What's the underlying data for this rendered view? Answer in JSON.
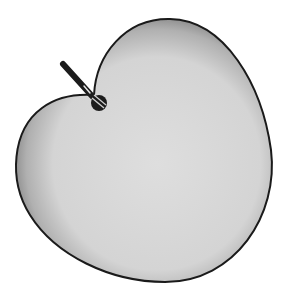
{
  "diagram": {
    "type": "cardioid-polar-pattern",
    "colors": {
      "background": "#ffffff",
      "fill_center": "#dcdcdc",
      "fill_edge": "#8a8a8a",
      "outline": "#1a1a1a",
      "microphone": "#1c1c1c"
    }
  }
}
